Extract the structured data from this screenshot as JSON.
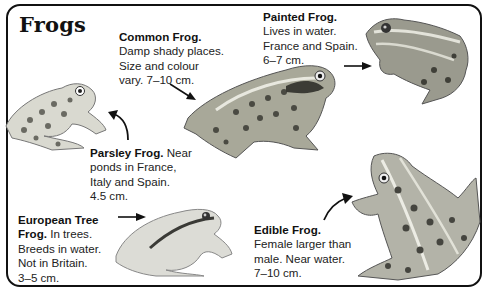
{
  "title": "Frogs",
  "species": [
    {
      "name": "Common Frog.",
      "lines": [
        "Damp shady places.",
        "Size and colour",
        "vary. 7–10 cm."
      ]
    },
    {
      "name": "Painted Frog.",
      "lines": [
        "Lives in water.",
        "France and Spain.",
        "6–7 cm."
      ]
    },
    {
      "name": "Parsley Frog.",
      "name_suffix": "Near",
      "lines": [
        "ponds in France,",
        "Italy and Spain.",
        "4.5 cm."
      ]
    },
    {
      "name": "European Tree",
      "name2": "Frog.",
      "name2_suffix": "In trees.",
      "lines": [
        "Breeds in water.",
        "Not in Britain.",
        "3–5 cm."
      ]
    },
    {
      "name": "Edible Frog.",
      "lines": [
        "Female larger than",
        "male. Near water.",
        "7–10 cm."
      ]
    }
  ]
}
